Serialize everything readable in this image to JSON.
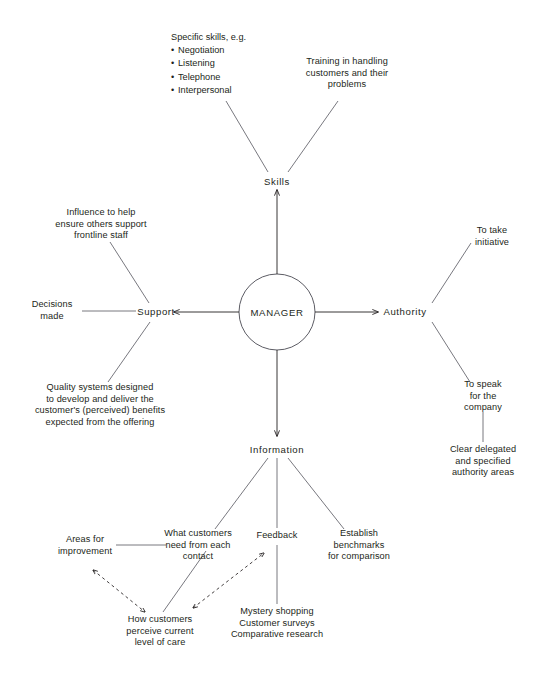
{
  "diagram": {
    "title": "MANAGER",
    "center": {
      "label": "MANAGER",
      "cx": 277,
      "cy": 312,
      "r": 38
    },
    "hubs": {
      "skills": "Skills",
      "support": "Support",
      "authority": "Authority",
      "information": "Information"
    },
    "skills_branch": {
      "specific_skills_heading": "Specific skills, e.g.",
      "specific_skills_items": [
        "Negotiation",
        "Listening",
        "Telephone",
        "Interpersonal"
      ],
      "training": "Training in handling\ncustomers and their\nproblems"
    },
    "support_branch": {
      "influence": "Influence to help\nensure others support\nfrontline staff",
      "decisions": "Decisions\nmade",
      "quality_systems": "Quality systems designed\nto develop and deliver the\ncustomer's (perceived) benefits\nexpected from the offering"
    },
    "authority_branch": {
      "initiative": "To take\ninitiative",
      "speak": "To speak\nfor the\ncompany",
      "delegated": "Clear delegated\nand specified\nauthority areas"
    },
    "information_branch": {
      "what_customers_need": "What customers\nneed from each\ncontact",
      "feedback": "Feedback",
      "benchmarks": "Establish\nbenchmarks\nfor comparison",
      "areas_for_improvement": "Areas for\nimprovement",
      "how_customers_perceive": "How customers\nperceive current\nlevel of care",
      "methods": "Mystery shopping\nCustomer surveys\nComparative research"
    },
    "colors": {
      "ink": "#231f20",
      "line": "#3b3b42",
      "background": "#ffffff"
    }
  }
}
